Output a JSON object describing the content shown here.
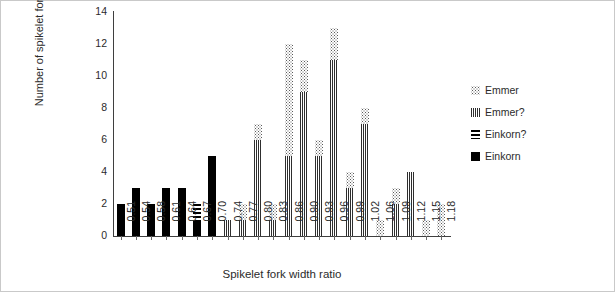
{
  "chart_data": {
    "type": "bar",
    "title": "",
    "xlabel": "Spikelet fork width ratio",
    "ylabel": "Number of spikelet forks",
    "ylim": [
      0,
      14
    ],
    "yticks": [
      0,
      2,
      4,
      6,
      8,
      10,
      12,
      14
    ],
    "grid": false,
    "stacked": true,
    "legend_position": "right",
    "categories": [
      "0.51",
      "0.54",
      "0.58",
      "0.61",
      "0.64",
      "0.67",
      "0.70",
      "0.74",
      "0.77",
      "0.80",
      "0.83",
      "0.86",
      "0.90",
      "0.93",
      "0.96",
      "0.99",
      "1.02",
      "1.06",
      "1.09",
      "1.12",
      "1.15",
      "1.18"
    ],
    "series": [
      {
        "name": "Einkorn",
        "pattern": "solid-black",
        "color": "#000000",
        "values": [
          2,
          3,
          2,
          3,
          3,
          1,
          5,
          0,
          0,
          0,
          0,
          0,
          0,
          0,
          0,
          0,
          0,
          0,
          0,
          0,
          0,
          0
        ]
      },
      {
        "name": "Einkorn?",
        "pattern": "horizontal-lines",
        "color": "#000000",
        "values": [
          0,
          0,
          0,
          0,
          0,
          1,
          0,
          0,
          0,
          0,
          0,
          0,
          0,
          0,
          0,
          0,
          0,
          0,
          0,
          0,
          0,
          0
        ]
      },
      {
        "name": "Emmer?",
        "pattern": "vertical-lines",
        "color": "#2e2e2e",
        "values": [
          0,
          0,
          0,
          0,
          0,
          0,
          0,
          1,
          1,
          6,
          1,
          5,
          9,
          5,
          11,
          3,
          7,
          0,
          2,
          4,
          0,
          0
        ]
      },
      {
        "name": "Emmer",
        "pattern": "dotted",
        "color": "#5a5a5a",
        "values": [
          0,
          0,
          0,
          0,
          0,
          0,
          0,
          0,
          1,
          1,
          1,
          7,
          2,
          1,
          2,
          1,
          1,
          1,
          1,
          0,
          1,
          2
        ]
      }
    ],
    "totals": [
      2,
      3,
      2,
      3,
      3,
      2,
      5,
      1,
      2,
      7,
      2,
      12,
      11,
      6,
      13,
      4,
      8,
      1,
      3,
      4,
      1,
      2
    ]
  },
  "legend": {
    "items": [
      {
        "label": "Emmer",
        "pattern": "dotted"
      },
      {
        "label": "Emmer?",
        "pattern": "vertical-lines"
      },
      {
        "label": "Einkorn?",
        "pattern": "horizontal-lines"
      },
      {
        "label": "Einkorn",
        "pattern": "solid-black"
      }
    ]
  }
}
